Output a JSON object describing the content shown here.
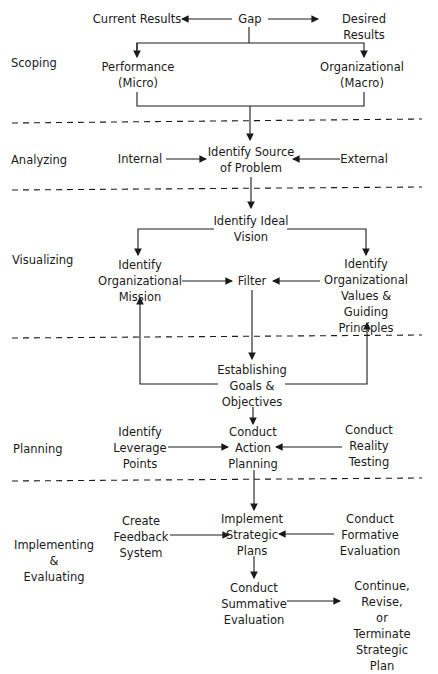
{
  "phases": [
    {
      "label": "Scoping"
    },
    {
      "label": "Analyzing"
    },
    {
      "label": "Visualizing"
    },
    {
      "label": "Planning"
    },
    {
      "label": "Implementing\n&\nEvaluating"
    }
  ],
  "nodes": {
    "current_results": "Current Results",
    "gap": "Gap",
    "desired_results": "Desired Results",
    "performance": "Performance\n(Micro)",
    "organizational": "Organizational\n(Macro)",
    "internal": "Internal",
    "identify_source": "Identify Source\nof Problem",
    "external": "External",
    "ideal_vision": "Identify Ideal\nVision",
    "org_mission": "Identify\nOrganizational\nMission",
    "filter": "Filter",
    "org_values": "Identify\nOrganizational\nValues & Guiding\nPrinciples",
    "goals": "Establishing\nGoals &\nObjectives",
    "leverage": "Identify\nLeverage\nPoints",
    "action_planning": "Conduct\nAction\nPlanning",
    "reality_testing": "Conduct\nReality\nTesting",
    "feedback": "Create\nFeedback\nSystem",
    "implement": "Implement\nStrategic\nPlans",
    "formative": "Conduct\nFormative\nEvaluation",
    "summative": "Conduct\nSummative\nEvaluation",
    "continue": "Continue, Revise,\nor Terminate\nStrategic Plan"
  }
}
